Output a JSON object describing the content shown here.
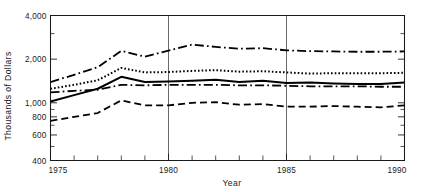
{
  "chart_data": {
    "type": "line",
    "title": "",
    "xlabel": "Year",
    "ylabel": "Thousands of Dollars",
    "yscale": "log",
    "ylim": [
      400,
      4000
    ],
    "xlim": [
      1975,
      1990
    ],
    "grid": "vertical-at-1980-and-1985",
    "legend": "none",
    "x": [
      1975,
      1976,
      1977,
      1978,
      1979,
      1980,
      1981,
      1982,
      1983,
      1984,
      1985,
      1986,
      1987,
      1988,
      1989,
      1990
    ],
    "y_tick_labels": [
      "400",
      "600",
      "800",
      "1,000",
      "2,000",
      "4,000"
    ],
    "y_tick_values": [
      400,
      600,
      800,
      1000,
      2000,
      4000
    ],
    "x_tick_labels": [
      "1975",
      "1980",
      "1985",
      "1990"
    ],
    "x_tick_values": [
      1975,
      1980,
      1985,
      1990
    ],
    "series": [
      {
        "name": "upper-dash-dot",
        "style": "dash-dot",
        "values": [
          1390,
          1560,
          1760,
          2280,
          2080,
          2290,
          2520,
          2430,
          2360,
          2380,
          2300,
          2270,
          2260,
          2250,
          2250,
          2260
        ]
      },
      {
        "name": "dotted",
        "style": "dotted",
        "values": [
          1250,
          1330,
          1430,
          1740,
          1620,
          1630,
          1660,
          1680,
          1640,
          1650,
          1620,
          1590,
          1600,
          1600,
          1600,
          1610
        ]
      },
      {
        "name": "solid",
        "style": "solid",
        "values": [
          1020,
          1130,
          1250,
          1510,
          1390,
          1400,
          1420,
          1440,
          1390,
          1420,
          1370,
          1380,
          1360,
          1350,
          1350,
          1380
        ]
      },
      {
        "name": "lower-dash-dot",
        "style": "dash-dot",
        "values": [
          1180,
          1210,
          1230,
          1330,
          1320,
          1330,
          1330,
          1330,
          1320,
          1320,
          1310,
          1300,
          1300,
          1300,
          1290,
          1290
        ]
      },
      {
        "name": "dashed",
        "style": "dashed",
        "values": [
          750,
          800,
          850,
          1040,
          960,
          960,
          1000,
          1010,
          970,
          980,
          940,
          940,
          950,
          940,
          930,
          960
        ]
      }
    ]
  },
  "axes": {
    "y_axis_title": "Thousands of Dollars",
    "x_axis_title": "Year",
    "y_labels": {
      "v400": "400",
      "v600": "600",
      "v800": "800",
      "v1000": "1,000",
      "v2000": "2,000",
      "v4000": "4,000"
    },
    "x_labels": {
      "v1975": "1975",
      "v1980": "1980",
      "v1985": "1985",
      "v1990": "1990"
    }
  },
  "colors": {
    "ink": "#111111",
    "background": "#ffffff"
  }
}
